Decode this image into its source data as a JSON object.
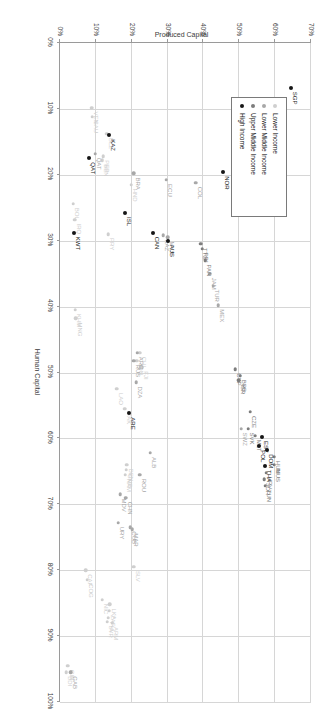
{
  "chart_data": {
    "type": "scatter",
    "title": "",
    "xlabel": "Human Capital",
    "ylabel": "Produced Capital",
    "xlim": [
      0,
      1.0
    ],
    "ylim": [
      0,
      0.7
    ],
    "xticks": [
      "0%",
      "10%",
      "20%",
      "30%",
      "40%",
      "50%",
      "60%",
      "70%",
      "80%",
      "90%",
      "100%"
    ],
    "yticks": [
      "0%",
      "10%",
      "20%",
      "30%",
      "40%",
      "50%",
      "60%",
      "70%"
    ],
    "grid": true,
    "legend_position": "top-left",
    "colors": {
      "lower_income": "#cfcfcf",
      "lower_middle_income": "#a8a8a8",
      "upper_middle_income": "#7d7d7d",
      "high_income": "#161616",
      "grid": "#d6d6d6",
      "axis": "#9a9a9a",
      "background": "#ffffff"
    },
    "legend": [
      {
        "label": "Lower Income",
        "group": "lower_income"
      },
      {
        "label": "Lower Middle Income",
        "group": "lower_middle_income"
      },
      {
        "label": "Upper Middle Income",
        "group": "upper_middle_income"
      },
      {
        "label": "High Income",
        "group": "high_income"
      }
    ],
    "series": [
      {
        "name": "Lower Income",
        "group": "lower_income",
        "points": [
          {
            "label": "BDI",
            "x": 0.955,
            "y": 0.018
          },
          {
            "label": "GIN",
            "x": 0.945,
            "y": 0.022
          },
          {
            "label": "CAF",
            "x": 0.8,
            "y": 0.072
          },
          {
            "label": "COG",
            "x": 0.815,
            "y": 0.075
          },
          {
            "label": "NIC",
            "x": 0.845,
            "y": 0.117
          },
          {
            "label": "LAO",
            "x": 0.525,
            "y": 0.158
          },
          {
            "label": "KHM",
            "x": 0.405,
            "y": 0.043
          },
          {
            "label": "MNG",
            "x": 0.418,
            "y": 0.044
          },
          {
            "label": "NAM",
            "x": 0.655,
            "y": 0.182
          },
          {
            "label": "GMB",
            "x": 0.648,
            "y": 0.184
          },
          {
            "label": "BEN",
            "x": 0.64,
            "y": 0.186
          },
          {
            "label": "PAK",
            "x": 0.555,
            "y": 0.18
          },
          {
            "label": "SYR",
            "x": 0.878,
            "y": 0.131
          },
          {
            "label": "PHL",
            "x": 0.872,
            "y": 0.134
          },
          {
            "label": "ZAF",
            "x": 0.862,
            "y": 0.137
          },
          {
            "label": "LKA",
            "x": 0.852,
            "y": 0.139
          },
          {
            "label": "ARM",
            "x": 0.88,
            "y": 0.146
          },
          {
            "label": "SLV",
            "x": 0.795,
            "y": 0.205
          },
          {
            "label": "BOL",
            "x": 0.244,
            "y": 0.036
          },
          {
            "label": "IRQ",
            "x": 0.268,
            "y": 0.041
          },
          {
            "label": "SAU",
            "x": 0.112,
            "y": 0.09
          },
          {
            "label": "VEN",
            "x": 0.098,
            "y": 0.088
          },
          {
            "label": "BEN2",
            "x": 0.178,
            "y": 0.118
          },
          {
            "label": "PER",
            "x": 0.172,
            "y": 0.121
          },
          {
            "label": "BLZ",
            "x": 0.138,
            "y": 0.13
          },
          {
            "label": "PRY",
            "x": 0.29,
            "y": 0.135
          },
          {
            "label": "HND",
            "x": 0.215,
            "y": 0.198
          },
          {
            "label": "IDN",
            "x": 0.482,
            "y": 0.214
          },
          {
            "label": "FJI",
            "x": 0.492,
            "y": 0.228
          },
          {
            "label": "CHL2",
            "x": 0.47,
            "y": 0.222
          }
        ]
      },
      {
        "name": "Lower Middle Income",
        "group": "lower_middle_income",
        "points": [
          {
            "label": "KGZ",
            "x": 0.892,
            "y": 0.905
          },
          {
            "label": "BWA",
            "x": 0.905,
            "y": 0.905
          },
          {
            "label": "MDV",
            "x": 0.685,
            "y": 0.168
          },
          {
            "label": "CHN",
            "x": 0.69,
            "y": 0.183
          },
          {
            "label": "URY",
            "x": 0.728,
            "y": 0.162
          },
          {
            "label": "CUB",
            "x": 0.735,
            "y": 0.196
          },
          {
            "label": "MAR",
            "x": 0.738,
            "y": 0.202
          },
          {
            "label": "ROU",
            "x": 0.655,
            "y": 0.222
          },
          {
            "label": "ALB",
            "x": 0.622,
            "y": 0.252
          },
          {
            "label": "DZA",
            "x": 0.515,
            "y": 0.212
          },
          {
            "label": "ARG",
            "x": 0.47,
            "y": 0.216
          },
          {
            "label": "RUS",
            "x": 0.482,
            "y": 0.205
          },
          {
            "label": "TUR",
            "x": 0.368,
            "y": 0.427
          },
          {
            "label": "JAM",
            "x": 0.35,
            "y": 0.418
          },
          {
            "label": "MEX",
            "x": 0.398,
            "y": 0.441
          },
          {
            "label": "ECU",
            "x": 0.208,
            "y": 0.297
          },
          {
            "label": "COL",
            "x": 0.212,
            "y": 0.378
          },
          {
            "label": "KAZ",
            "x": 0.292,
            "y": 0.288
          },
          {
            "label": "MYS",
            "x": 0.295,
            "y": 0.3
          },
          {
            "label": "BRA",
            "x": 0.198,
            "y": 0.205
          },
          {
            "label": "SWZ",
            "x": 0.585,
            "y": 0.505
          },
          {
            "label": "QAT2",
            "x": 0.168,
            "y": 0.098
          },
          {
            "label": "GAB",
            "x": 0.955,
            "y": 0.03
          }
        ]
      },
      {
        "name": "Upper Middle Income",
        "group": "upper_middle_income",
        "points": [
          {
            "label": "HUN",
            "x": 0.628,
            "y": 0.598
          },
          {
            "label": "MUS",
            "x": 0.64,
            "y": 0.598
          },
          {
            "label": "HRV",
            "x": 0.652,
            "y": 0.575
          },
          {
            "label": "TUN",
            "x": 0.672,
            "y": 0.572
          },
          {
            "label": "JOR",
            "x": 0.662,
            "y": 0.57
          },
          {
            "label": "SVK",
            "x": 0.585,
            "y": 0.524
          },
          {
            "label": "MLT",
            "x": 0.596,
            "y": 0.545
          },
          {
            "label": "CZE",
            "x": 0.56,
            "y": 0.53
          },
          {
            "label": "CYP",
            "x": 0.495,
            "y": 0.488
          },
          {
            "label": "BRB",
            "x": 0.505,
            "y": 0.502
          },
          {
            "label": "ISR",
            "x": 0.512,
            "y": 0.498
          },
          {
            "label": "PAN",
            "x": 0.33,
            "y": 0.405
          },
          {
            "label": "TTO",
            "x": 0.305,
            "y": 0.392
          },
          {
            "label": "PRI",
            "x": 0.312,
            "y": 0.396
          }
        ]
      },
      {
        "name": "High Income",
        "group": "high_income",
        "points": [
          {
            "label": "SGP",
            "x": 0.068,
            "y": 0.645
          },
          {
            "label": "LUX",
            "x": 0.132,
            "y": 0.572
          },
          {
            "label": "ESP",
            "x": 0.095,
            "y": 0.588
          },
          {
            "label": "FRA",
            "x": 0.11,
            "y": 0.58
          },
          {
            "label": "KOR",
            "x": 0.1,
            "y": 0.56
          },
          {
            "label": "ITA",
            "x": 0.125,
            "y": 0.565
          },
          {
            "label": "BEL",
            "x": 0.158,
            "y": 0.552
          },
          {
            "label": "DNK",
            "x": 0.148,
            "y": 0.548
          },
          {
            "label": "MHL",
            "x": 0.138,
            "y": 0.535
          },
          {
            "label": "NLD",
            "x": 0.13,
            "y": 0.546
          },
          {
            "label": "GBR",
            "x": 0.12,
            "y": 0.556
          },
          {
            "label": "AUT",
            "x": 0.142,
            "y": 0.56
          },
          {
            "label": "DEU",
            "x": 0.205,
            "y": 0.522
          },
          {
            "label": "FIN",
            "x": 0.19,
            "y": 0.508
          },
          {
            "label": "SVN",
            "x": 0.208,
            "y": 0.5
          },
          {
            "label": "GRC",
            "x": 0.198,
            "y": 0.496
          },
          {
            "label": "USA",
            "x": 0.182,
            "y": 0.492
          },
          {
            "label": "NOR",
            "x": 0.196,
            "y": 0.455
          },
          {
            "label": "EST",
            "x": 0.598,
            "y": 0.562
          },
          {
            "label": "DOM",
            "x": 0.618,
            "y": 0.578
          },
          {
            "label": "THA",
            "x": 0.642,
            "y": 0.572
          },
          {
            "label": "POL",
            "x": 0.612,
            "y": 0.555
          },
          {
            "label": "AUS",
            "x": 0.3,
            "y": 0.302
          },
          {
            "label": "CAN",
            "x": 0.288,
            "y": 0.26
          },
          {
            "label": "ISL",
            "x": 0.258,
            "y": 0.182
          },
          {
            "label": "KWT",
            "x": 0.288,
            "y": 0.04
          },
          {
            "label": "QAT",
            "x": 0.175,
            "y": 0.082
          },
          {
            "label": "KAZ2",
            "x": 0.14,
            "y": 0.138
          },
          {
            "label": "ARE",
            "x": 0.562,
            "y": 0.192
          },
          {
            "label": "ARB",
            "x": 0.905,
            "y": 0.9
          },
          {
            "label": "TJK",
            "x": 0.952,
            "y": 0.948
          },
          {
            "label": "MMR",
            "x": 0.958,
            "y": 0.948
          },
          {
            "label": "GEO",
            "x": 0.962,
            "y": 0.94
          },
          {
            "label": "CIV",
            "x": 0.968,
            "y": 0.935
          },
          {
            "label": "TZA",
            "x": 0.975,
            "y": 0.955
          },
          {
            "label": "UGA",
            "x": 0.98,
            "y": 0.96
          },
          {
            "label": "ETH",
            "x": 0.985,
            "y": 0.965
          },
          {
            "label": "NPL",
            "x": 0.988,
            "y": 0.97
          },
          {
            "label": "MLI",
            "x": 0.99,
            "y": 0.975
          },
          {
            "label": "NER",
            "x": 0.992,
            "y": 0.978
          },
          {
            "label": "TCD",
            "x": 0.994,
            "y": 0.982
          },
          {
            "label": "MOZ",
            "x": 0.996,
            "y": 0.985
          },
          {
            "label": "RWA",
            "x": 0.997,
            "y": 0.988
          },
          {
            "label": "MWI",
            "x": 0.998,
            "y": 0.99
          },
          {
            "label": "SLE",
            "x": 0.999,
            "y": 0.992
          }
        ]
      }
    ],
    "cluster_note": "dense cluster of country markers near 100% human capital"
  }
}
